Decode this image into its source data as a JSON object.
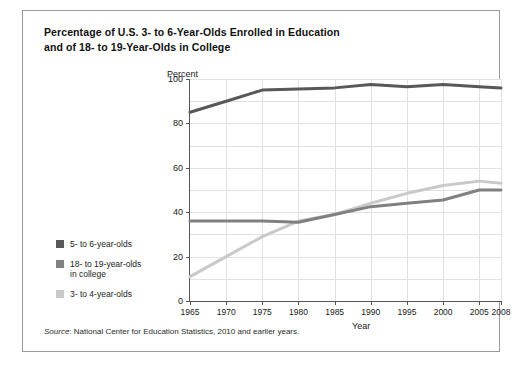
{
  "title": {
    "line1": "Percentage of U.S. 3- to 6-Year-Olds Enrolled in Education",
    "line2": "and of 18- to 19-Year-Olds in College"
  },
  "source": {
    "label": "Source",
    "text": ": National Center for Education Statistics, 2010 and earlier years."
  },
  "legend": {
    "items": [
      {
        "label": "5- to 6-year-olds",
        "color": "#585858"
      },
      {
        "label": "18- to 19-year-olds\nin college",
        "color": "#808080"
      },
      {
        "label": "3- to 4-year-olds",
        "color": "#c9c9c9"
      }
    ]
  },
  "chart_data": {
    "type": "line",
    "title": "Percentage of U.S. 3- to 6-Year-Olds Enrolled in Education and of 18- to 19-Year-Olds in College",
    "xlabel": "Year",
    "ylabel": "Percent",
    "xlim": [
      1965,
      2008
    ],
    "ylim": [
      0,
      100
    ],
    "ytick_labels": [
      "0",
      "20",
      "40",
      "60",
      "80",
      "100"
    ],
    "yticks": [
      0,
      20,
      40,
      60,
      80,
      100
    ],
    "y_minor_gridlines": [
      10,
      30,
      50,
      70,
      90
    ],
    "xticks": [
      1965,
      1970,
      1975,
      1980,
      1985,
      1990,
      1995,
      2000,
      2005,
      2008
    ],
    "xtick_labels": [
      "1965",
      "1970",
      "1975",
      "1980",
      "1985",
      "1990",
      "1995",
      "2000",
      "2005",
      "2008"
    ],
    "grid": true,
    "legend_position": "lower-left-outside",
    "x": [
      1965,
      1970,
      1975,
      1980,
      1985,
      1990,
      1995,
      2000,
      2005,
      2008
    ],
    "series": [
      {
        "name": "5- to 6-year-olds",
        "color": "#585858",
        "values": [
          85,
          90,
          95,
          95.5,
          96,
          97.5,
          96.5,
          97.5,
          96.5,
          96
        ]
      },
      {
        "name": "18- to 19-year-olds in college",
        "color": "#808080",
        "values": [
          36,
          36,
          36,
          35.5,
          39,
          42.5,
          44,
          45.5,
          50,
          50
        ]
      },
      {
        "name": "3- to 4-year-olds",
        "color": "#c9c9c9",
        "values": [
          11,
          20,
          29,
          36,
          39,
          44,
          48.5,
          52,
          54,
          53
        ]
      }
    ]
  }
}
